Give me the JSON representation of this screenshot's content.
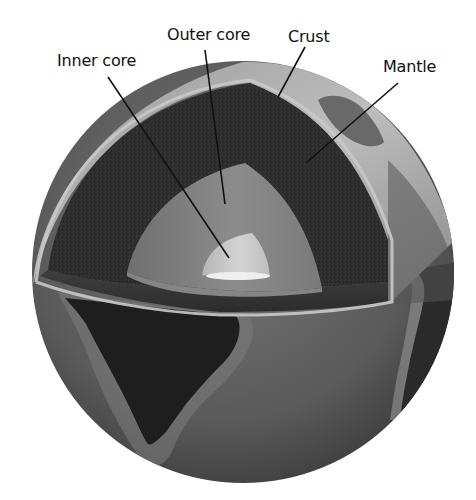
{
  "figure": {
    "labels": {
      "inner_core": "Inner core",
      "outer_core": "Outer core",
      "crust": "Crust",
      "mantle": "Mantle"
    }
  },
  "layers": [
    {
      "name": "Crust",
      "color": "#b8b8b8"
    },
    {
      "name": "Mantle",
      "color": "#2e2e2e"
    },
    {
      "name": "Outer core",
      "color": "#7d7d7d"
    },
    {
      "name": "Inner core",
      "color": "#c9c9c9"
    }
  ],
  "globe_surface": {
    "visible_landmasses": [
      "South America",
      "Africa (west coast)",
      "Europe"
    ]
  }
}
